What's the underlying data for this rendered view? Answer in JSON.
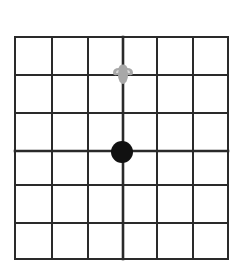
{
  "diagram": {
    "type": "grid",
    "rows": 6,
    "columns": 6,
    "grid_color": "#2a2a2a",
    "background": "#ffffff",
    "vertical_lines_x": [
      15,
      52,
      88,
      123,
      157,
      193,
      228
    ],
    "horizontal_lines_y": [
      37,
      75,
      113,
      151,
      185,
      223,
      259
    ],
    "emphasized_vertical_index": 3,
    "emphasized_horizontal_index": 3
  },
  "markers": [
    {
      "name": "figure-marker",
      "icon": "person-topdown-icon",
      "color": "#a8a8a8",
      "cx": 123,
      "cy": 74
    },
    {
      "name": "dot-marker",
      "icon": "filled-circle-icon",
      "color": "#111111",
      "cx": 122,
      "cy": 152,
      "r": 11
    }
  ]
}
